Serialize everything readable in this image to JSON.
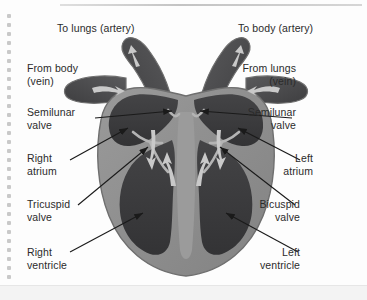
{
  "page": {
    "background": "#fdfdfd",
    "binding_dot_color": "#c9c9c9",
    "binding_dot_count": 30
  },
  "diagram": {
    "colors": {
      "chamber_dark": "#3a3a3c",
      "muscle_mid": "#8d8d8d",
      "vessel_dark": "#4a4a4c",
      "arrow_light": "#c9c9c9",
      "outline": "#6f6f6f",
      "leader_line": "#1a1a1a",
      "text": "#2b2b2b"
    },
    "labels": [
      {
        "id": "to-lungs-artery",
        "text": "To lungs (artery)",
        "align": "left",
        "x": 57,
        "y": 22
      },
      {
        "id": "to-body-artery",
        "text": "To body (artery)",
        "align": "left",
        "x": 238,
        "y": 22
      },
      {
        "id": "from-body-vein",
        "text": "From body\n(vein)",
        "align": "left",
        "x": 27,
        "y": 62
      },
      {
        "id": "from-lungs-vein",
        "text": "From lungs\n(vein)",
        "align": "right",
        "x": 296,
        "y": 62
      },
      {
        "id": "semilunar-valve-left",
        "text": "Semilunar\nvalve",
        "align": "left",
        "x": 27,
        "y": 106
      },
      {
        "id": "semilunar-valve-right",
        "text": "Semilunar\nvalve",
        "align": "right",
        "x": 296,
        "y": 106
      },
      {
        "id": "right-atrium",
        "text": "Right\natrium",
        "align": "left",
        "x": 27,
        "y": 152
      },
      {
        "id": "left-atrium",
        "text": "Left\natrium",
        "align": "right",
        "x": 313,
        "y": 152
      },
      {
        "id": "tricuspid-valve",
        "text": "Tricuspid\nvalve",
        "align": "left",
        "x": 27,
        "y": 198
      },
      {
        "id": "bicuspid-valve",
        "text": "Bicuspid\nvalve",
        "align": "right",
        "x": 300,
        "y": 198
      },
      {
        "id": "right-ventricle",
        "text": "Right\nventricle",
        "align": "left",
        "x": 27,
        "y": 246
      },
      {
        "id": "left-ventricle",
        "text": "Left\nventricle",
        "align": "right",
        "x": 300,
        "y": 246
      }
    ],
    "leaders": [
      {
        "id": "leader-semilunar-left",
        "from": [
          95,
          118
        ],
        "to": [
          172,
          111
        ],
        "arrow": true
      },
      {
        "id": "leader-semilunar-right",
        "from": [
          292,
          118
        ],
        "to": [
          200,
          111
        ],
        "arrow": true
      },
      {
        "id": "leader-right-atrium",
        "from": [
          70,
          160
        ],
        "to": [
          128,
          128
        ],
        "arrow": true
      },
      {
        "id": "leader-left-atrium",
        "from": [
          300,
          160
        ],
        "to": [
          238,
          128
        ],
        "arrow": true
      },
      {
        "id": "leader-tricuspid",
        "from": [
          78,
          205
        ],
        "to": [
          148,
          147
        ],
        "arrow": true
      },
      {
        "id": "leader-bicuspid",
        "from": [
          295,
          205
        ],
        "to": [
          220,
          147
        ],
        "arrow": true
      },
      {
        "id": "leader-right-ventricle",
        "from": [
          70,
          252
        ],
        "to": [
          143,
          213
        ],
        "arrow": true
      },
      {
        "id": "leader-left-ventricle",
        "from": [
          298,
          252
        ],
        "to": [
          226,
          213
        ],
        "arrow": true
      }
    ],
    "flow_arrows": [
      {
        "id": "arrow-pulmonary-artery-out",
        "direction": "up-left"
      },
      {
        "id": "arrow-aorta-out",
        "direction": "up-right"
      },
      {
        "id": "arrow-vena-cava-in",
        "direction": "right"
      },
      {
        "id": "arrow-pulmonary-vein-in",
        "direction": "left"
      },
      {
        "id": "arrow-right-atrium-down",
        "direction": "down"
      },
      {
        "id": "arrow-right-ventricle-up",
        "direction": "up"
      },
      {
        "id": "arrow-left-atrium-down",
        "direction": "down"
      },
      {
        "id": "arrow-left-ventricle-up",
        "direction": "up"
      }
    ]
  }
}
